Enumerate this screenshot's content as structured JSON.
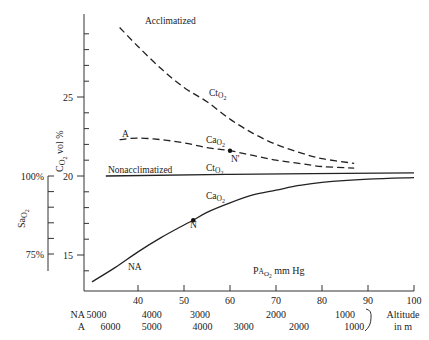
{
  "chart_data": {
    "type": "line",
    "title": "",
    "xlabel": "PA O2 mm Hg",
    "ylabel": "C O2 vol %",
    "ylabel_secondary": "Sa O2",
    "xlim": [
      30,
      100
    ],
    "ylim": [
      13,
      30
    ],
    "x_ticks": [
      40,
      50,
      60,
      70,
      80,
      90,
      100
    ],
    "y_ticks": [
      15,
      20,
      25
    ],
    "y2_ticks": [
      "100%",
      "75%"
    ],
    "grid": false,
    "series": [
      {
        "name": "Acclimatized CtO2",
        "style": "dashed",
        "label": "Acclimatized",
        "sublabel": "CtO2",
        "points": [
          [
            36,
            29.4
          ],
          [
            40,
            28.2
          ],
          [
            45,
            26.8
          ],
          [
            50,
            25.6
          ],
          [
            55,
            24.7
          ],
          [
            60,
            23.6
          ],
          [
            65,
            22.7
          ],
          [
            70,
            22.0
          ],
          [
            75,
            21.5
          ],
          [
            80,
            21.1
          ],
          [
            87,
            20.8
          ]
        ]
      },
      {
        "name": "Acclimatized CaO2 (A)",
        "style": "dashed",
        "label": "A",
        "sublabel": "CaO2",
        "points": [
          [
            36,
            22.3
          ],
          [
            40,
            22.4
          ],
          [
            45,
            22.3
          ],
          [
            50,
            22.1
          ],
          [
            55,
            21.8
          ],
          [
            60,
            21.6
          ],
          [
            65,
            21.3
          ],
          [
            70,
            21.0
          ],
          [
            75,
            20.8
          ],
          [
            80,
            20.6
          ],
          [
            87,
            20.5
          ]
        ]
      },
      {
        "name": "Nonacclimatized CtO2",
        "style": "solid",
        "label": "Nonacclimatized",
        "sublabel": "CtO2",
        "points": [
          [
            33,
            20.0
          ],
          [
            60,
            20.1
          ],
          [
            100,
            20.2
          ]
        ]
      },
      {
        "name": "Nonacclimatized CaO2 (NA)",
        "style": "solid",
        "label": "NA",
        "sublabel": "CaO2",
        "points": [
          [
            30,
            13.3
          ],
          [
            35,
            14.2
          ],
          [
            40,
            15.2
          ],
          [
            45,
            16.1
          ],
          [
            50,
            16.9
          ],
          [
            52,
            17.2
          ],
          [
            55,
            17.7
          ],
          [
            60,
            18.3
          ],
          [
            65,
            18.8
          ],
          [
            70,
            19.1
          ],
          [
            75,
            19.4
          ],
          [
            80,
            19.6
          ],
          [
            90,
            19.8
          ],
          [
            100,
            19.9
          ]
        ]
      }
    ],
    "annotations": [
      {
        "label": "N",
        "x": 52,
        "y": 17.2
      },
      {
        "label": "N'",
        "x": 60,
        "y": 21.6
      }
    ],
    "altitude_scale": {
      "title": "Altitude in m",
      "NA": [
        {
          "label": "5000",
          "x": 31
        },
        {
          "label": "4000",
          "x": 43
        },
        {
          "label": "3000",
          "x": 53.5
        },
        {
          "label": "2000",
          "x": 70
        },
        {
          "label": "1000",
          "x": 85
        }
      ],
      "A": [
        {
          "label": "6000",
          "x": 34
        },
        {
          "label": "5000",
          "x": 43
        },
        {
          "label": "4000",
          "x": 54
        },
        {
          "label": "3000",
          "x": 63
        },
        {
          "label": "2000",
          "x": 75
        },
        {
          "label": "1000",
          "x": 87
        }
      ]
    }
  },
  "labels": {
    "acclimatized": "Acclimatized",
    "nonacclimatized": "Nonacclimatized",
    "a": "A",
    "na": "NA",
    "n": "N",
    "n_prime": "N'",
    "ct": "Ct",
    "ca": "Ca",
    "o2": "O",
    "two": "2",
    "y_axis_main": "C",
    "y_axis_unit": " vol %",
    "y2_axis": "Sa",
    "x_axis_p": "P",
    "x_axis_a": "A",
    "x_axis_unit": " mm Hg",
    "pct100": "100%",
    "pct75": "75%",
    "row_na": "NA",
    "row_a": "A",
    "altitude": "Altitude",
    "in_m": "in m"
  }
}
